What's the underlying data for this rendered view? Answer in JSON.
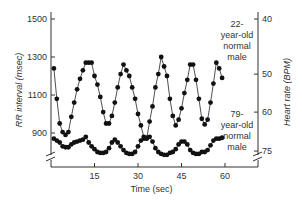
{
  "chart_data": {
    "type": "line",
    "title": "",
    "xlabel": "Time (sec)",
    "ylabel": "RR interval (msec)",
    "y2label": "Heart rate (BPM)",
    "xlim": [
      0,
      68
    ],
    "ylim": [
      740,
      1540
    ],
    "x_ticks": [
      15,
      30,
      45,
      60
    ],
    "y_ticks": [
      900,
      1100,
      1300,
      1500
    ],
    "y2_ticks": [
      {
        "label": "40",
        "rr": 1500
      },
      {
        "label": "50",
        "rr": 1210
      },
      {
        "label": "60",
        "rr": 1010
      },
      {
        "label": "75",
        "rr": 805
      }
    ],
    "grid": false,
    "axis_breaks": true,
    "series": [
      {
        "name": "22-year-old normal male",
        "marker": "circle",
        "x": [
          1,
          2,
          3,
          4,
          5,
          6,
          7,
          8,
          9,
          10,
          11,
          12,
          13,
          14,
          15,
          16,
          17,
          18,
          19,
          20,
          21,
          22,
          23,
          24,
          25,
          26,
          27,
          28,
          29,
          30,
          31,
          32,
          33,
          34,
          35,
          36,
          37,
          38,
          39,
          40,
          41,
          42,
          43,
          44,
          45,
          46,
          47,
          48,
          49,
          50,
          51,
          52,
          53,
          54,
          55,
          56,
          57,
          58,
          59
        ],
        "values": [
          1240,
          1080,
          950,
          905,
          890,
          905,
          985,
          1060,
          1130,
          1185,
          1230,
          1270,
          1270,
          1270,
          1200,
          1155,
          1090,
          1010,
          950,
          950,
          990,
          1060,
          1140,
          1210,
          1260,
          1230,
          1200,
          1140,
          1080,
          1000,
          940,
          880,
          870,
          960,
          1040,
          1140,
          1210,
          1300,
          1250,
          1200,
          1080,
          990,
          940,
          970,
          1030,
          1110,
          1180,
          1260,
          1260,
          1180,
          1080,
          975,
          945,
          970,
          1060,
          1160,
          1270,
          1240,
          1190
        ]
      },
      {
        "name": "79-year-old normal male",
        "marker": "circle",
        "x": [
          1,
          2,
          3,
          4,
          5,
          6,
          7,
          8,
          9,
          10,
          11,
          12,
          13,
          14,
          15,
          16,
          17,
          18,
          19,
          20,
          21,
          22,
          23,
          24,
          25,
          26,
          27,
          28,
          29,
          30,
          31,
          32,
          33,
          34,
          35,
          36,
          37,
          38,
          39,
          40,
          41,
          42,
          43,
          44,
          45,
          46,
          47,
          48,
          49,
          50,
          51,
          52,
          53,
          54,
          55,
          56,
          57,
          58,
          59
        ],
        "values": [
          870,
          860,
          850,
          830,
          825,
          825,
          840,
          850,
          855,
          860,
          865,
          880,
          850,
          830,
          815,
          800,
          795,
          795,
          800,
          820,
          850,
          865,
          850,
          830,
          810,
          795,
          790,
          790,
          800,
          830,
          860,
          870,
          875,
          880,
          855,
          820,
          800,
          790,
          785,
          785,
          795,
          800,
          815,
          840,
          855,
          855,
          840,
          810,
          795,
          790,
          790,
          800,
          800,
          810,
          835,
          860,
          870,
          870,
          875
        ]
      }
    ],
    "annotations": [
      {
        "text_lines": [
          "22-",
          "year-old",
          "normal",
          "male"
        ],
        "series": 0
      },
      {
        "text_lines": [
          "79-",
          "year-old",
          "normal",
          "male"
        ],
        "series": 1
      }
    ]
  },
  "labels": {
    "ylabel": "RR interval (msec)",
    "y2label": "Heart rate (BPM)",
    "xlabel": "Time (sec)",
    "annot_young": [
      "22-",
      "year-old",
      "normal",
      "male"
    ],
    "annot_old": [
      "79-",
      "year-old",
      "normal",
      "male"
    ]
  }
}
